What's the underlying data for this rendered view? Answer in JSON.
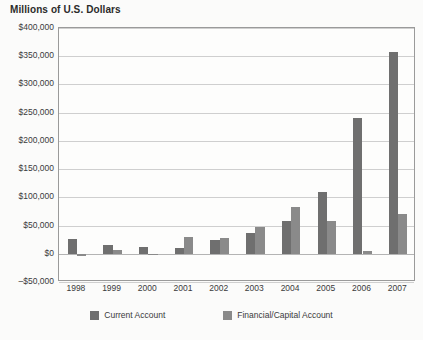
{
  "chart_data": {
    "type": "bar",
    "title": "Millions of U.S. Dollars",
    "xlabel": "",
    "ylabel": "",
    "ylim": [
      -50000,
      400000
    ],
    "ytick_step": 50000,
    "grid": true,
    "legend_position": "bottom",
    "categories": [
      "1998",
      "1999",
      "2000",
      "2001",
      "2002",
      "2003",
      "2004",
      "2005",
      "2006",
      "2007"
    ],
    "ytick_labels": [
      "$400,000",
      "$350,000",
      "$300,000",
      "$250,000",
      "$200,000",
      "$150,000",
      "$100,000",
      "$50,000",
      "$0",
      "–$50,000"
    ],
    "ytick_values": [
      400000,
      350000,
      300000,
      250000,
      200000,
      150000,
      100000,
      50000,
      0,
      -50000
    ],
    "series": [
      {
        "name": "Current Account",
        "color": "#6f6f6f",
        "values": [
          26000,
          16000,
          12000,
          10000,
          25000,
          37000,
          58000,
          110000,
          240000,
          357000
        ]
      },
      {
        "name": "Financial/Capital Account",
        "color": "#8a8a8a",
        "values": [
          -4000,
          6000,
          -3000,
          30000,
          28000,
          48000,
          83000,
          58000,
          5000,
          70000
        ]
      }
    ]
  },
  "legend": {
    "items": [
      {
        "label": "Current Account"
      },
      {
        "label": "Financial/Capital Account"
      }
    ]
  }
}
